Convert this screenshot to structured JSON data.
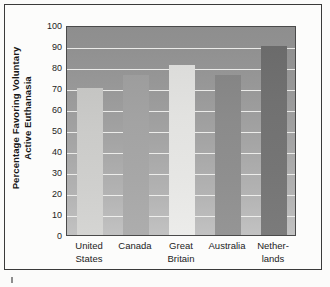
{
  "chart_data": {
    "type": "bar",
    "title": "",
    "subtitle": "",
    "xlabel": "",
    "ylabel": "Percentage Favoring Voluntary Active Euthanasia",
    "ylabel_lines": [
      "Percentage Favoring Voluntary",
      "Active Euthanasia"
    ],
    "categories": [
      "United States",
      "Canada",
      "Great Britain",
      "Australia",
      "Netherlands"
    ],
    "category_lines": [
      [
        "United",
        "States"
      ],
      [
        "Canada",
        ""
      ],
      [
        "Great",
        "Britain"
      ],
      [
        "Australia",
        ""
      ],
      [
        "Nether-",
        "lands"
      ]
    ],
    "values": [
      70,
      76,
      81,
      76,
      90
    ],
    "ylim": [
      0,
      100
    ],
    "ytick_values": [
      100,
      90,
      80,
      70,
      60,
      50,
      40,
      30,
      20,
      10,
      0
    ],
    "ytick_labels": [
      "100",
      "90",
      "80",
      "70",
      "60",
      "50",
      "40",
      "30",
      "20",
      "10",
      "0"
    ],
    "grid": true,
    "grid_color": "#f2f2f0",
    "legend": "none",
    "bar_colors": [
      "#cfcfcd",
      "#a7a7a7",
      "#e6e6e4",
      "#8f8f8f",
      "#757575"
    ],
    "plot_bg_top": "#8e8e8e",
    "plot_bg_bottom": "#c2c2c2",
    "axis_color": "#4a4a4a",
    "text_color": "#232323",
    "frame_color": "#3a3a3a"
  }
}
